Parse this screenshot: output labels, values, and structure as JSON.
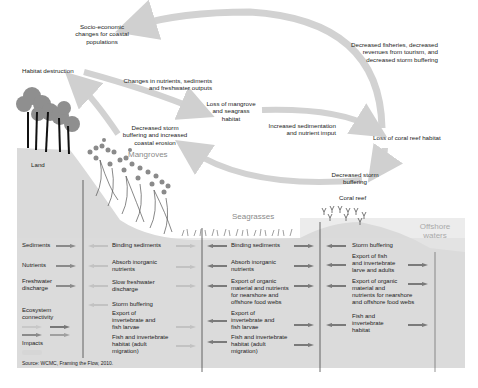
{
  "diagram": {
    "title_nodes": {
      "socio_economic": [
        "Socio-economic",
        "changes for coastal",
        "populations"
      ],
      "habitat_destruction": "Habitat destruction",
      "changes_nutrients": [
        "Changes in nutrients, sediments",
        "and freshwater outputs"
      ],
      "loss_mangrove": [
        "Loss of mangrove",
        "and seagrass",
        "habitat"
      ],
      "decreased_fisheries": [
        "Decreased fisheries, decreased",
        "revenues from tourism, and",
        "decreased storm buffering"
      ],
      "increased_sedimentation": [
        "Increased sedimentation",
        "and nutrient imput"
      ],
      "loss_coral": "Loss of coral reef habitat",
      "decreased_storm_erosion": [
        "Decreased storm",
        "buffering and increased",
        "coastal erosion"
      ],
      "decreased_storm": [
        "Decreased storm",
        "buffering"
      ]
    },
    "zones": {
      "land": "Land",
      "mangroves": "Mangroves",
      "seagrasses": "Seagrasses",
      "coral_reef": "Coral reef",
      "offshore": [
        "Offshore",
        "waters"
      ]
    },
    "legend": {
      "rows": [
        "Sediments",
        "Nutrients",
        "Freshwater discharge",
        "Ecosystem connectivity",
        "Impacts"
      ],
      "freshwater": [
        "Freshwater",
        "discharge"
      ],
      "ecosystem": [
        "Ecosystem",
        "connectivity"
      ]
    },
    "columns": {
      "mangroves": [
        "Binding sediments",
        [
          "Absorb inorganic",
          "nutrients"
        ],
        [
          "Slow freshwater",
          "discharge"
        ],
        "Storm buffering",
        [
          "Export of",
          "invertebrate and",
          "fish larvae"
        ],
        [
          "Fish and invertebrate",
          "habitat (adult",
          "migration)"
        ]
      ],
      "seagrasses": [
        "Binding sediments",
        [
          "Absorb inorganic",
          "nutrients"
        ],
        [
          "Export of organic",
          "material and nutrients",
          "for nearshore and",
          "offshore food webs"
        ],
        [
          "Export of",
          "invertebrate and",
          "fish larvae"
        ],
        [
          "Fish and invertebrate",
          "habitat (adult",
          "migration)"
        ]
      ],
      "coral_reef": [
        "Storm buffering",
        [
          "Export of fish",
          "and invertebrate",
          "larve and adults"
        ],
        [
          "Export of organic",
          "material and",
          "nutrients for nearshore",
          "and offshore food webs"
        ],
        [
          "Fish and",
          "invertebrate",
          "habitat"
        ]
      ]
    },
    "source": "Source: WCMC,  Framing the Flow,  2010."
  },
  "colors": {
    "arrow_light": "#d2d2d2",
    "arrow_mid": "#a8a8a8",
    "arrow_dark": "#7a7a7a",
    "ground": "#dcdcdc",
    "zone_text": "#8a8a8a"
  }
}
